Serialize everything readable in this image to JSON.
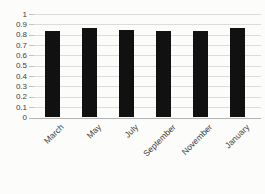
{
  "chart_data": {
    "type": "bar",
    "title": "",
    "xlabel": "",
    "ylabel": "",
    "categories": [
      "March",
      "May",
      "July",
      "September",
      "November",
      "January"
    ],
    "values": [
      0.84,
      0.86,
      0.85,
      0.84,
      0.84,
      0.86
    ],
    "ylim": [
      0,
      1
    ],
    "y_tick_step": 0.1,
    "y_tick_labels": [
      "0",
      "0.1",
      "0.2",
      "0.3",
      "0.4",
      "0.5",
      "0.6",
      "0.7",
      "0.8",
      "0.9",
      "1"
    ],
    "grid": true,
    "legend_position": "none",
    "bar_color": "#111111"
  },
  "colors": {
    "background": "#fcfcfb",
    "gridline": "#dcdcdc",
    "axis": "#b3b3b3",
    "label": "#404040"
  }
}
